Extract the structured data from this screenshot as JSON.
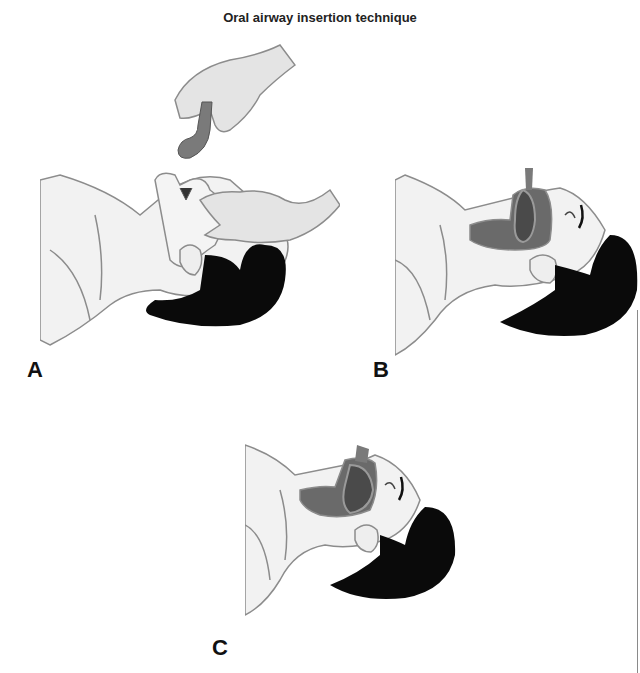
{
  "figure": {
    "title": "Oral airway insertion technique",
    "panels": [
      {
        "label": "A",
        "description": "Gloved hand holding oral airway above patient's open mouth; second hand opening jaw (crossed-finger technique)"
      },
      {
        "label": "B",
        "description": "Oral airway inserted into mouth, curved toward roof of mouth, shown in cross-section"
      },
      {
        "label": "C",
        "description": "Oral airway rotated into final position following the curve of the tongue"
      }
    ],
    "colors": {
      "skin": "#f2f2f2",
      "outline": "#8c8c8c",
      "hair": "#0a0a0a",
      "airway": "#7a7a7a",
      "oral_cavity": "#4a4a4a",
      "glove": "#e0e0e0"
    }
  }
}
